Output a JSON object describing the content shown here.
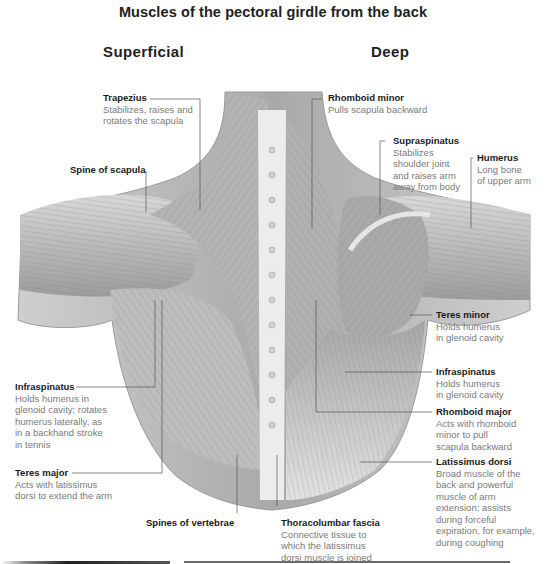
{
  "title": "Muscles of the pectoral girdle from the back",
  "sections": {
    "left": "Superficial",
    "right": "Deep"
  },
  "labels": {
    "trapezius": {
      "name": "Trapezius",
      "desc": [
        "Stabilizes, raises and",
        "rotates the scapula"
      ]
    },
    "spine_of_scapula": {
      "name": "Spine of scapula",
      "desc": []
    },
    "infraspinatus_left": {
      "name": "Infraspinatus",
      "desc": [
        "Holds humerus in",
        "glenoid cavity; rotates",
        "humerus laterally, as",
        "in a backhand stroke",
        "in tennis"
      ]
    },
    "teres_major": {
      "name": "Teres major",
      "desc": [
        "Acts with latissimus",
        "dorsi to extend the arm"
      ]
    },
    "spines_of_vertebrae": {
      "name": "Spines of vertebrae",
      "desc": []
    },
    "rhomboid_minor": {
      "name": "Rhomboid minor",
      "desc": [
        "Pulls scapula backward"
      ]
    },
    "supraspinatus": {
      "name": "Supraspinatus",
      "desc": [
        "Stabilizes",
        "shoulder joint",
        "and raises arm",
        "away from body"
      ]
    },
    "humerus": {
      "name": "Humerus",
      "desc": [
        "Long bone",
        "of upper arm"
      ]
    },
    "teres_minor": {
      "name": "Teres minor",
      "desc": [
        "Holds humerus",
        "in glenoid cavity"
      ]
    },
    "infraspinatus_right": {
      "name": "Infraspinatus",
      "desc": [
        "Holds humerus",
        "in glenoid cavity"
      ]
    },
    "rhomboid_major": {
      "name": "Rhomboid major",
      "desc": [
        "Acts with rhomboid",
        "minor to pull",
        "scapula backward"
      ]
    },
    "latissimus_dorsi": {
      "name": "Latissimus dorsi",
      "desc": [
        "Broad muscle of the",
        "back and powerful",
        "muscle of arm",
        "extension; assists",
        "during forceful",
        "expiration, for example,",
        "during coughing"
      ]
    },
    "thoracolumbar_fascia": {
      "name": "Thoracolumbar fascia",
      "desc": [
        "Connective tissue to",
        "which the latissimus",
        "dorsi muscle is joined"
      ]
    }
  },
  "colors": {
    "muscle_fill": "#b9b9b9",
    "muscle_dark": "#8a8a8a",
    "fascia": "#e8e8e8",
    "leader_line": "#555555",
    "label_name": "#1a1a1a",
    "label_desc": "#7a7a7a"
  }
}
